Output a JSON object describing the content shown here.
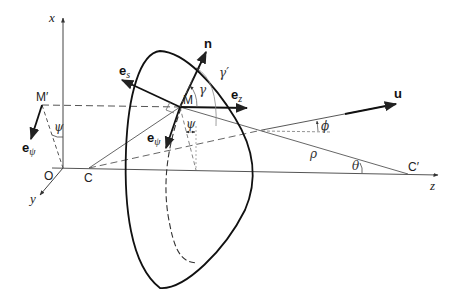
{
  "diagram": {
    "axes": {
      "x": "x",
      "y": "y",
      "z": "z",
      "origin": "O"
    },
    "points": {
      "M": "M",
      "M_prime": "M′",
      "C": "C",
      "C_prime": "C′"
    },
    "vectors": {
      "n": "n",
      "u": "u",
      "e_s": {
        "base": "e",
        "sub": "s"
      },
      "e_z": {
        "base": "e",
        "sub": "z"
      },
      "e_psi_M": {
        "base": "e",
        "sub": "ψ"
      },
      "e_psi_Mprime": {
        "base": "e",
        "sub": "ψ"
      }
    },
    "angles": {
      "gamma": "γ",
      "gamma_prime": "γ′",
      "psi_M": "ψ",
      "psi_Mprime": "ψ",
      "phi": "ϕ",
      "theta": "θ",
      "rho": "ρ"
    },
    "colors": {
      "stroke": "#222222",
      "thin": "#555555",
      "background": "#ffffff"
    }
  }
}
